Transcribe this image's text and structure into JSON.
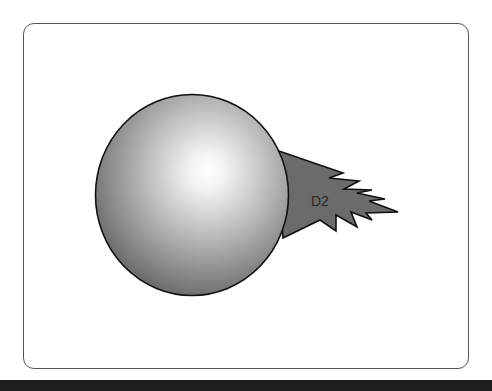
{
  "diagram": {
    "elements": [
      {
        "id": "sphere",
        "type": "shaded-sphere",
        "label": ""
      },
      {
        "id": "d2",
        "type": "jagged-beam",
        "label": "D2"
      }
    ],
    "colors": {
      "frame_border": "#555555",
      "beam_fill": "#6b6b6b",
      "outline": "#111111",
      "sphere_highlight": "#ffffff",
      "sphere_shadow": "#5a5a5a",
      "bottom_bar": "#1e1e1e"
    }
  }
}
